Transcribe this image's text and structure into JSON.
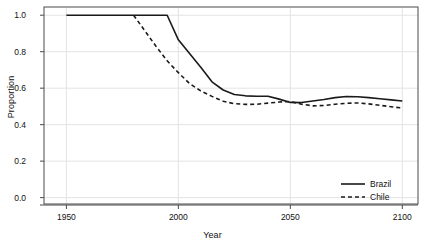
{
  "chart_data": {
    "type": "line",
    "title": "",
    "xlabel": "Year",
    "ylabel": "Proportion",
    "xlim": [
      1940,
      2107
    ],
    "ylim": [
      -0.035,
      1.045
    ],
    "grid": true,
    "grid_color": "#e3e3e3",
    "legend_position": "bottom-right",
    "xticks": [
      1950,
      2000,
      2050,
      2100
    ],
    "xtick_labels": [
      "1950",
      "2000",
      "2050",
      "2100"
    ],
    "yticks": [
      0.0,
      0.2,
      0.4,
      0.6,
      0.8,
      1.0
    ],
    "ytick_labels": [
      "0.0",
      "0.2",
      "0.4",
      "0.6",
      "0.8",
      "1.0"
    ],
    "series": [
      {
        "name": "Brazil",
        "style": "solid",
        "color": "#1a1a1a",
        "x": [
          1950,
          1955,
          1960,
          1965,
          1970,
          1975,
          1980,
          1985,
          1990,
          1995,
          2000,
          2005,
          2010,
          2015,
          2020,
          2025,
          2030,
          2035,
          2040,
          2045,
          2050,
          2055,
          2060,
          2065,
          2070,
          2075,
          2080,
          2085,
          2090,
          2095,
          2100
        ],
        "y": [
          1.0,
          1.0,
          1.0,
          1.0,
          1.0,
          1.0,
          1.0,
          1.0,
          1.0,
          1.0,
          0.865,
          0.79,
          0.715,
          0.635,
          0.59,
          0.565,
          0.558,
          0.556,
          0.556,
          0.54,
          0.522,
          0.521,
          0.53,
          0.538,
          0.548,
          0.554,
          0.553,
          0.548,
          0.542,
          0.536,
          0.53
        ]
      },
      {
        "name": "Chile",
        "style": "dashed",
        "color": "#1a1a1a",
        "x": [
          1980,
          1985,
          1990,
          1995,
          2000,
          2005,
          2010,
          2015,
          2020,
          2025,
          2030,
          2035,
          2040,
          2045,
          2050,
          2055,
          2060,
          2065,
          2070,
          2075,
          2080,
          2085,
          2090,
          2095,
          2100
        ],
        "y": [
          1.0,
          0.915,
          0.83,
          0.75,
          0.685,
          0.625,
          0.585,
          0.555,
          0.528,
          0.515,
          0.511,
          0.512,
          0.518,
          0.524,
          0.527,
          0.512,
          0.503,
          0.505,
          0.512,
          0.517,
          0.519,
          0.514,
          0.506,
          0.498,
          0.491
        ]
      }
    ]
  },
  "legend": {
    "items": [
      {
        "label": "Brazil",
        "style": "solid"
      },
      {
        "label": "Chile",
        "style": "dashed"
      }
    ]
  }
}
